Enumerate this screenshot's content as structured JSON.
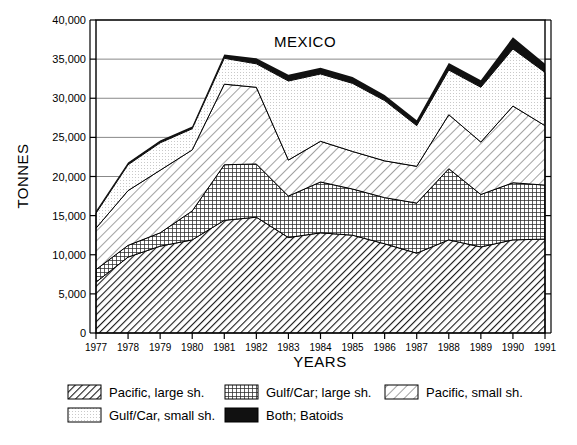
{
  "chart_data": {
    "type": "area",
    "title": "MEXICO",
    "xlabel": "YEARS",
    "ylabel": "TONNES",
    "stacked": true,
    "grid": true,
    "legend_position": "bottom",
    "categories": [
      1977,
      1978,
      1979,
      1980,
      1981,
      1982,
      1983,
      1984,
      1985,
      1986,
      1987,
      1988,
      1989,
      1990,
      1991
    ],
    "x": [
      "1977",
      "1978",
      "1979",
      "1980",
      "1981",
      "1982",
      "1983",
      "1984",
      "1985",
      "1986",
      "1987",
      "1988",
      "1989",
      "1990",
      "1991"
    ],
    "ylim": [
      0,
      40000
    ],
    "yticks": [
      0,
      5000,
      10000,
      15000,
      20000,
      25000,
      30000,
      35000,
      40000
    ],
    "ytick_labels": [
      "0",
      "5,000",
      "10,000",
      "15,000",
      "20,000",
      "25,000",
      "30,000",
      "35,000",
      "40,000"
    ],
    "series": [
      {
        "name": "Pacific, large sh.",
        "pattern": "diagonal-dense",
        "values": [
          6500,
          9700,
          11100,
          11900,
          14400,
          14800,
          12200,
          12800,
          12500,
          11400,
          10200,
          11900,
          11000,
          11900,
          12000
        ]
      },
      {
        "name": "Gulf/Car; large sh.",
        "pattern": "crosshatch",
        "values": [
          1600,
          1500,
          1700,
          3700,
          7100,
          6800,
          5300,
          6500,
          5900,
          5900,
          6400,
          9100,
          6700,
          7300,
          6900
        ]
      },
      {
        "name": "Pacific, small sh.",
        "pattern": "diagonal-light",
        "values": [
          5300,
          7000,
          8000,
          7800,
          10300,
          9800,
          4600,
          5200,
          4800,
          4700,
          4700,
          6900,
          6700,
          9800,
          7600
        ]
      },
      {
        "name": "Gulf/Car, small sh.",
        "pattern": "stipple",
        "values": [
          1900,
          3300,
          3500,
          2700,
          3300,
          3000,
          10100,
          8600,
          8700,
          7700,
          5200,
          5700,
          7000,
          7300,
          6800
        ]
      },
      {
        "name": "Both; Batoids",
        "pattern": "solid-black",
        "values": [
          300,
          300,
          300,
          300,
          500,
          700,
          800,
          800,
          800,
          700,
          700,
          900,
          900,
          1500,
          1100
        ]
      }
    ],
    "totals": [
      15600,
      21800,
      24600,
      26400,
      35600,
      35100,
      33000,
      33900,
      32700,
      30400,
      27200,
      34500,
      32300,
      37800,
      34400
    ]
  },
  "legend": {
    "items": [
      {
        "label": "Pacific, large sh.",
        "pattern": "diagonal-dense"
      },
      {
        "label": "Gulf/Car; large sh.",
        "pattern": "crosshatch"
      },
      {
        "label": "Pacific, small sh.",
        "pattern": "diagonal-light"
      },
      {
        "label": "Gulf/Car, small sh.",
        "pattern": "stipple"
      },
      {
        "label": "Both; Batoids",
        "pattern": "solid-black"
      }
    ]
  },
  "colors": {
    "axis": "#000000",
    "grid": "#888888",
    "background": "#ffffff",
    "batoids": "#111111"
  }
}
